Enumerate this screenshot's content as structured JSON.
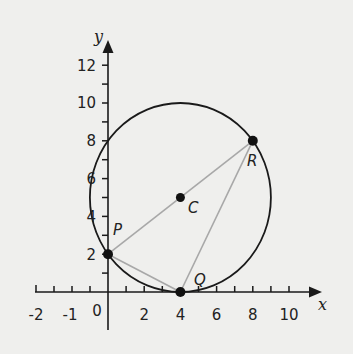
{
  "diagram": {
    "axes": {
      "x_label": "x",
      "y_label": "y",
      "x_ticks": [
        {
          "value": -2,
          "label": "-2"
        },
        {
          "value": -1,
          "label": "-1"
        },
        {
          "value": 0,
          "label": "0"
        },
        {
          "value": 2,
          "label": "2"
        },
        {
          "value": 4,
          "label": "4"
        },
        {
          "value": 6,
          "label": "6"
        },
        {
          "value": 8,
          "label": "8"
        },
        {
          "value": 10,
          "label": "10"
        }
      ],
      "y_ticks": [
        {
          "value": 2,
          "label": "2"
        },
        {
          "value": 4,
          "label": "4"
        },
        {
          "value": 6,
          "label": "6"
        },
        {
          "value": 8,
          "label": "8"
        },
        {
          "value": 10,
          "label": "10"
        },
        {
          "value": 12,
          "label": "12"
        }
      ]
    },
    "circle": {
      "center": "C",
      "cx": 4,
      "cy": 5,
      "r": 5
    },
    "points": {
      "P": {
        "label": "P",
        "x": 0,
        "y": 2
      },
      "Q": {
        "label": "Q",
        "x": 4,
        "y": 0
      },
      "R": {
        "label": "R",
        "x": 8,
        "y": 8
      },
      "C": {
        "label": "C",
        "x": 4,
        "y": 5
      }
    },
    "segments": [
      [
        "P",
        "R"
      ],
      [
        "P",
        "Q"
      ],
      [
        "Q",
        "R"
      ]
    ],
    "colors": {
      "background": "#efefed",
      "ink": "#1a1a1a",
      "segment": "#a8a8a8"
    }
  }
}
